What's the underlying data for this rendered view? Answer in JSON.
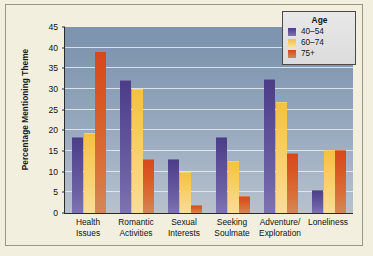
{
  "chart_data": {
    "type": "bar",
    "title": "",
    "xlabel": "",
    "ylabel": "Percentage Mentioning Theme",
    "ylim": [
      0,
      45
    ],
    "yticks": [
      0,
      5,
      10,
      15,
      20,
      25,
      30,
      35,
      40,
      45
    ],
    "grid": true,
    "legend_position": "top-right",
    "legend_title": "Age",
    "categories": [
      "Health\nIssues",
      "Romantic\nActivities",
      "Sexual\nInterests",
      "Seeking\nSoulmate",
      "Adventure/\nExploration",
      "Loneliness"
    ],
    "category_lines": [
      [
        "Health",
        "Issues"
      ],
      [
        "Romantic",
        "Activities"
      ],
      [
        "Sexual",
        "Interests"
      ],
      [
        "Seeking",
        "Soulmate"
      ],
      [
        "Adventure/",
        "Exploration"
      ],
      [
        "Loneliness",
        ""
      ]
    ],
    "series": [
      {
        "name": "40–54",
        "color": "#5b4d96",
        "values": [
          18.5,
          32.2,
          13.0,
          18.5,
          32.4,
          5.6
        ]
      },
      {
        "name": "60–74",
        "color": "#f6c040",
        "values": [
          19.3,
          29.9,
          9.9,
          12.7,
          26.8,
          15.3
        ]
      },
      {
        "name": "75+",
        "color": "#d8471b",
        "values": [
          39.3,
          13.0,
          2.0,
          4.0,
          14.6,
          15.2
        ]
      }
    ]
  },
  "legend": {
    "title": "Age",
    "entries": [
      {
        "label": "40–54",
        "swatch": "purple-swatch"
      },
      {
        "label": "60–74",
        "swatch": "yellow-swatch"
      },
      {
        "label": "75+",
        "swatch": "orange-swatch"
      }
    ]
  },
  "axes": {
    "y_title": "Percentage Mentioning Theme",
    "y_ticks": [
      "0",
      "5",
      "10",
      "15",
      "20",
      "25",
      "30",
      "35",
      "40",
      "45"
    ]
  },
  "colors": {
    "figure_background": "#f2efdf",
    "plot_background_top": "#7d93ae",
    "plot_background_bottom": "#b8c2cd",
    "gridline": "#e6ecf2",
    "axis": "#2a2a2a",
    "series_40_54": "#5b4d96",
    "series_60_74": "#f6c040",
    "series_75_plus": "#d8471b",
    "legend_background": "#e2e2e2",
    "legend_border": "#4a4a4a"
  }
}
